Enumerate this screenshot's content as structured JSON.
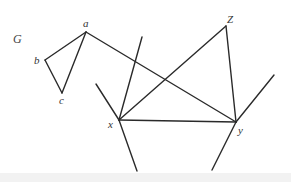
{
  "graph": {
    "name": "G",
    "vertices": [
      {
        "id": "a",
        "label": "a",
        "x": 86,
        "y": 32
      },
      {
        "id": "b",
        "label": "b",
        "x": 45,
        "y": 60
      },
      {
        "id": "c",
        "label": "c",
        "x": 62,
        "y": 93
      },
      {
        "id": "x",
        "label": "x",
        "x": 119,
        "y": 120
      },
      {
        "id": "y",
        "label": "y",
        "x": 236,
        "y": 122
      },
      {
        "id": "Z",
        "label": "Z",
        "x": 226,
        "y": 26
      }
    ],
    "edges": [
      [
        "a",
        "b"
      ],
      [
        "b",
        "c"
      ],
      [
        "c",
        "a"
      ],
      [
        "a",
        "y"
      ],
      [
        "x",
        "y"
      ],
      [
        "x",
        "Z"
      ],
      [
        "Z",
        "y"
      ]
    ],
    "half_edges": [
      {
        "from": "x",
        "to": [
          142,
          37
        ]
      },
      {
        "from": "x",
        "to": [
          96,
          84
        ]
      },
      {
        "from": "x",
        "to": [
          137,
          171
        ]
      },
      {
        "from": "y",
        "to": [
          274,
          75
        ]
      },
      {
        "from": "y",
        "to": [
          212,
          170
        ]
      }
    ]
  },
  "labels": {
    "graph_name": "G",
    "a": "a",
    "b": "b",
    "c": "c",
    "x": "x",
    "y": "y",
    "z": "Z"
  }
}
